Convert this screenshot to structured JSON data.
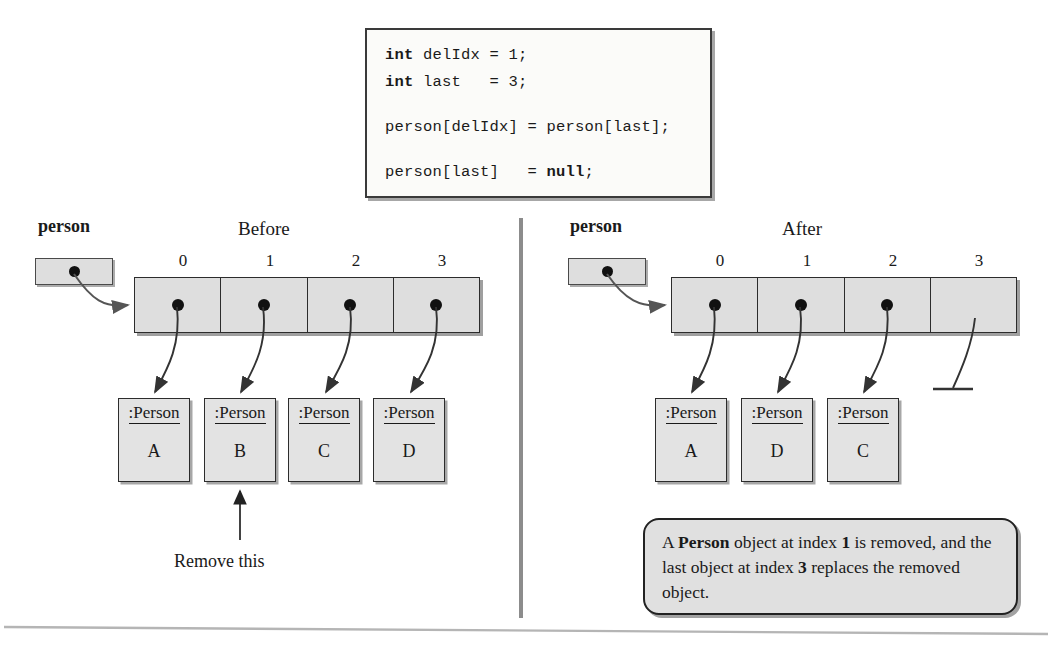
{
  "code": {
    "lines": [
      {
        "segments": [
          {
            "t": "int",
            "bold": true
          },
          {
            "t": " delIdx = 1;",
            "bold": false
          }
        ]
      },
      {
        "segments": [
          {
            "t": "int",
            "bold": true
          },
          {
            "t": " last   = 3;",
            "bold": false
          }
        ]
      },
      {
        "segments": [
          {
            "t": "",
            "bold": false
          }
        ]
      },
      {
        "segments": [
          {
            "t": "person[delIdx] = person[last];",
            "bold": false
          }
        ]
      },
      {
        "segments": [
          {
            "t": "",
            "bold": false
          }
        ]
      },
      {
        "segments": [
          {
            "t": "person[last]   = ",
            "bold": false
          },
          {
            "t": "null",
            "bold": true
          },
          {
            "t": ";",
            "bold": false
          }
        ]
      }
    ]
  },
  "before": {
    "heading": "Before",
    "variable_label": "person",
    "indices": [
      "0",
      "1",
      "2",
      "3"
    ],
    "objects": [
      {
        "type": ":Person",
        "value": "A"
      },
      {
        "type": ":Person",
        "value": "B"
      },
      {
        "type": ":Person",
        "value": "C"
      },
      {
        "type": ":Person",
        "value": "D"
      }
    ],
    "annotation": "Remove this"
  },
  "after": {
    "heading": "After",
    "variable_label": "person",
    "indices": [
      "0",
      "1",
      "2",
      "3"
    ],
    "objects": [
      {
        "type": ":Person",
        "value": "A"
      },
      {
        "type": ":Person",
        "value": "D"
      },
      {
        "type": ":Person",
        "value": "C"
      }
    ],
    "null_slot_index": "3",
    "note": {
      "parts": [
        {
          "t": "A ",
          "bold": false
        },
        {
          "t": "Person",
          "bold": true
        },
        {
          "t": " object at index ",
          "bold": false
        },
        {
          "t": "1",
          "bold": true
        },
        {
          "t": " is removed, and the last object at index ",
          "bold": false
        },
        {
          "t": "3",
          "bold": true
        },
        {
          "t": " replaces the removed object.",
          "bold": false
        }
      ]
    }
  },
  "colors": {
    "cell_fill": "#dedede",
    "object_fill": "#e3e3e3",
    "note_fill": "#e0e0e0",
    "stroke": "#2c2c2c",
    "code_fill": "#fbfbf9"
  }
}
